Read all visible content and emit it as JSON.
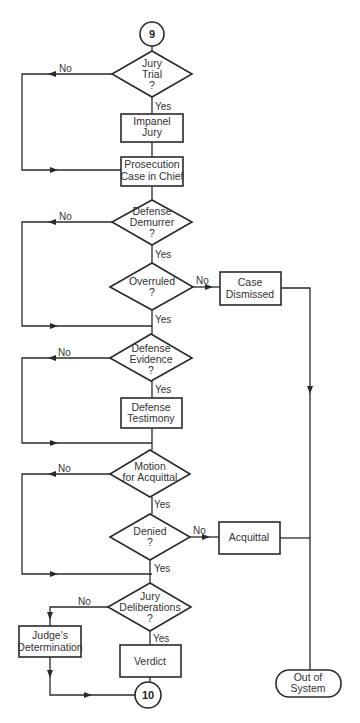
{
  "diagram": {
    "type": "flowchart",
    "connectors": {
      "start": "9",
      "end": "10"
    },
    "nodes": {
      "jury_trial": {
        "line1": "Jury",
        "line2": "Trial",
        "line3": "?"
      },
      "impanel_jury": {
        "line1": "Impanel",
        "line2": "Jury"
      },
      "prosecution": {
        "line1": "Prosecution",
        "line2": "Case in Chief"
      },
      "defense_demurrer": {
        "line1": "Defense",
        "line2": "Demurrer",
        "line3": "?"
      },
      "overruled": {
        "line1": "Overruled",
        "line2": "?"
      },
      "case_dismissed": {
        "line1": "Case",
        "line2": "Dismissed"
      },
      "defense_evidence": {
        "line1": "Defense",
        "line2": "Evidence",
        "line3": "?"
      },
      "defense_testimony": {
        "line1": "Defense",
        "line2": "Testimony"
      },
      "motion_acquittal": {
        "line1": "Motion",
        "line2": "for Acquittal"
      },
      "denied": {
        "line1": "Denied",
        "line2": "?"
      },
      "acquittal": {
        "line1": "Acquittal"
      },
      "jury_deliberations": {
        "line1": "Jury",
        "line2": "Deliberations",
        "line3": "?"
      },
      "judges_determination": {
        "line1": "Judge's",
        "line2": "Determination"
      },
      "verdict": {
        "line1": "Verdict"
      },
      "out_of_system": {
        "line1": "Out of",
        "line2": "System"
      }
    },
    "edge_labels": {
      "yes": "Yes",
      "no": "No"
    },
    "edges": [
      {
        "from": "9",
        "to": "Jury Trial ?"
      },
      {
        "from": "Jury Trial ?",
        "to": "Impanel Jury",
        "label": "Yes"
      },
      {
        "from": "Jury Trial ?",
        "to": "Prosecution Case in Chief",
        "label": "No"
      },
      {
        "from": "Impanel Jury",
        "to": "Prosecution Case in Chief"
      },
      {
        "from": "Prosecution Case in Chief",
        "to": "Defense Demurrer ?"
      },
      {
        "from": "Defense Demurrer ?",
        "to": "Overruled ?",
        "label": "Yes"
      },
      {
        "from": "Defense Demurrer ?",
        "to": "Defense Evidence ?",
        "label": "No"
      },
      {
        "from": "Overruled ?",
        "to": "Case Dismissed",
        "label": "No"
      },
      {
        "from": "Overruled ?",
        "to": "Defense Evidence ?",
        "label": "Yes"
      },
      {
        "from": "Case Dismissed",
        "to": "Out of System"
      },
      {
        "from": "Defense Evidence ?",
        "to": "Defense Testimony",
        "label": "Yes"
      },
      {
        "from": "Defense Evidence ?",
        "to": "Motion for Acquittal",
        "label": "No"
      },
      {
        "from": "Defense Testimony",
        "to": "Motion for Acquittal"
      },
      {
        "from": "Motion for Acquittal",
        "to": "Denied ?",
        "label": "Yes"
      },
      {
        "from": "Motion for Acquittal",
        "to": "Jury Deliberations ?",
        "label": "No"
      },
      {
        "from": "Denied ?",
        "to": "Acquittal",
        "label": "No"
      },
      {
        "from": "Denied ?",
        "to": "Jury Deliberations ?",
        "label": "Yes"
      },
      {
        "from": "Acquittal",
        "to": "Out of System"
      },
      {
        "from": "Jury Deliberations ?",
        "to": "Verdict",
        "label": "Yes"
      },
      {
        "from": "Jury Deliberations ?",
        "to": "Judge's Determination",
        "label": "No"
      },
      {
        "from": "Verdict",
        "to": "10"
      },
      {
        "from": "Judge's Determination",
        "to": "10"
      }
    ]
  }
}
